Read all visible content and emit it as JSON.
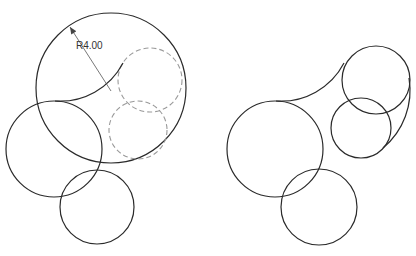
{
  "figures": [
    {
      "name": "before-fillet",
      "dimension_label": "R4.00",
      "circles": [
        {
          "role": "large-circle",
          "cx": 111,
          "cy": 88,
          "r": 75,
          "style": "solid"
        },
        {
          "role": "left-circle",
          "cx": 54,
          "cy": 149,
          "r": 48,
          "style": "solid"
        },
        {
          "role": "bottom-circle",
          "cx": 97,
          "cy": 207,
          "r": 37,
          "style": "solid"
        },
        {
          "role": "upper-inner-circle",
          "cx": 150,
          "cy": 80,
          "r": 32,
          "style": "dashed"
        },
        {
          "role": "lower-inner-circle",
          "cx": 138,
          "cy": 130,
          "r": 29,
          "style": "dashed"
        }
      ]
    },
    {
      "name": "after-fillet",
      "circles": [
        {
          "role": "left-circle",
          "cx": 275,
          "cy": 149,
          "r": 48,
          "style": "solid"
        },
        {
          "role": "bottom-circle",
          "cx": 319,
          "cy": 207,
          "r": 38,
          "style": "solid"
        },
        {
          "role": "upper-right-circle",
          "cx": 376,
          "cy": 80,
          "r": 34,
          "style": "solid"
        },
        {
          "role": "lower-right-circle",
          "cx": 361,
          "cy": 128,
          "r": 30,
          "style": "solid"
        }
      ]
    }
  ],
  "colors": {
    "stroke": "#2a2a2a",
    "dashed": "#9a9a9a",
    "background": "#ffffff"
  }
}
